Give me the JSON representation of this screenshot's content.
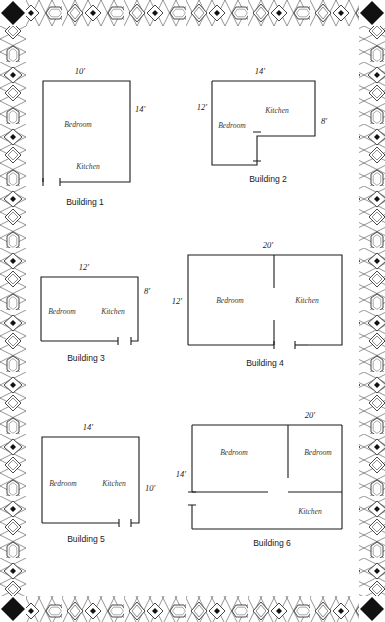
{
  "page": {
    "width": 385,
    "height": 622,
    "background_color": "#ffffff",
    "ink_color": "#1a1a1a"
  },
  "border": {
    "style_name": "ornate-diamond-cartouche-frame",
    "corner_marker": "solid-black-diamond",
    "motifs": [
      "diamond-outline",
      "diamond-with-dot",
      "elongated-hexagon-cartouche",
      "lattice-crosshatch"
    ],
    "corner_count": 4
  },
  "buildings": [
    {
      "id": "building-1",
      "caption": "Building 1",
      "shape": "rectangle",
      "rooms": [
        "Bedroom",
        "Kitchen"
      ],
      "dimensions": [
        {
          "label": "10'",
          "side": "top"
        },
        {
          "label": "14'",
          "side": "right"
        }
      ],
      "room_labels": [
        {
          "name": "Bedroom",
          "text": "Bedroom"
        },
        {
          "name": "Kitchen",
          "text": "Kitchen"
        }
      ]
    },
    {
      "id": "building-2",
      "caption": "Building 2",
      "shape": "l-shape",
      "rooms": [
        "Bedroom",
        "Kitchen"
      ],
      "dimensions": [
        {
          "label": "14'",
          "side": "top"
        },
        {
          "label": "12'",
          "side": "left"
        },
        {
          "label": "8'",
          "side": "right"
        }
      ],
      "room_labels": [
        {
          "name": "Bedroom",
          "text": "Bedroom"
        },
        {
          "name": "Kitchen",
          "text": "Kitchen"
        }
      ]
    },
    {
      "id": "building-3",
      "caption": "Building 3",
      "shape": "rectangle",
      "rooms": [
        "Bedroom",
        "Kitchen"
      ],
      "dimensions": [
        {
          "label": "12'",
          "side": "top"
        },
        {
          "label": "8'",
          "side": "right"
        }
      ],
      "room_labels": [
        {
          "name": "Bedroom",
          "text": "Bedroom"
        },
        {
          "name": "Kitchen",
          "text": "Kitchen"
        }
      ]
    },
    {
      "id": "building-4",
      "caption": "Building 4",
      "shape": "rectangle-with-interior-wall",
      "rooms": [
        "Bedroom",
        "Kitchen"
      ],
      "dimensions": [
        {
          "label": "20'",
          "side": "top"
        },
        {
          "label": "12'",
          "side": "left"
        }
      ],
      "room_labels": [
        {
          "name": "Bedroom",
          "text": "Bedroom"
        },
        {
          "name": "Kitchen",
          "text": "Kitchen"
        }
      ]
    },
    {
      "id": "building-5",
      "caption": "Building 5",
      "shape": "rectangle",
      "rooms": [
        "Bedroom",
        "Kitchen"
      ],
      "dimensions": [
        {
          "label": "14'",
          "side": "top"
        },
        {
          "label": "10'",
          "side": "right"
        }
      ],
      "room_labels": [
        {
          "name": "Bedroom",
          "text": "Bedroom"
        },
        {
          "name": "Kitchen",
          "text": "Kitchen"
        }
      ]
    },
    {
      "id": "building-6",
      "caption": "Building 6",
      "shape": "rectangle-with-two-interior-walls",
      "rooms": [
        "Bedroom",
        "Bedroom",
        "Kitchen"
      ],
      "dimensions": [
        {
          "label": "20'",
          "side": "top"
        },
        {
          "label": "14'",
          "side": "left"
        }
      ],
      "room_labels": [
        {
          "name": "Bedroom-left",
          "text": "Bedroom"
        },
        {
          "name": "Bedroom-right",
          "text": "Bedroom"
        },
        {
          "name": "Kitchen",
          "text": "Kitchen"
        }
      ]
    }
  ],
  "labels": {
    "b1_top": "10'",
    "b1_right": "14'",
    "b1_bedroom": "Bedroom",
    "b1_kitchen": "Kitchen",
    "b1_caption": "Building 1",
    "b2_top": "14'",
    "b2_left": "12'",
    "b2_right": "8'",
    "b2_bedroom": "Bedroom",
    "b2_kitchen": "Kitchen",
    "b2_caption": "Building 2",
    "b3_top": "12'",
    "b3_right": "8'",
    "b3_bedroom": "Bedroom",
    "b3_kitchen": "Kitchen",
    "b3_caption": "Building 3",
    "b4_top": "20'",
    "b4_left": "12'",
    "b4_bedroom": "Bedroom",
    "b4_kitchen": "Kitchen",
    "b4_caption": "Building 4",
    "b5_top": "14'",
    "b5_right": "10'",
    "b5_bedroom": "Bedroom",
    "b5_kitchen": "Kitchen",
    "b5_caption": "Building 5",
    "b6_top": "20'",
    "b6_left": "14'",
    "b6_bedroom_left": "Bedroom",
    "b6_bedroom_right": "Bedroom",
    "b6_kitchen": "Kitchen",
    "b6_caption": "Building 6"
  }
}
